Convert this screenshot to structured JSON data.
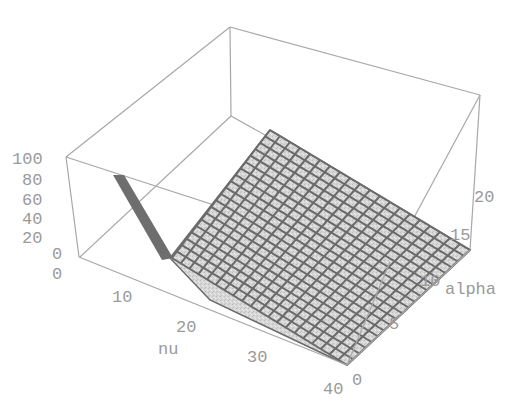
{
  "chart_data": {
    "type": "surface3d",
    "title": "",
    "xlabel": "nu",
    "ylabel": "alpha",
    "zlabel": "",
    "x_ticks": [
      "10",
      "20",
      "30",
      "40"
    ],
    "y_ticks": [
      "0",
      "5",
      "10",
      "15",
      "20"
    ],
    "z_ticks": [
      "0",
      "20",
      "40",
      "60",
      "80",
      "100"
    ],
    "xlim": [
      0,
      40
    ],
    "ylim": [
      0,
      20
    ],
    "zlim": [
      0,
      100
    ],
    "surface_samples": {
      "nu": [
        1,
        2,
        3,
        5,
        10,
        20,
        30,
        40
      ],
      "z_at_any_alpha": [
        100,
        60,
        20,
        3,
        0.5,
        0.1,
        0.05,
        0
      ]
    },
    "grid": true,
    "mesh_lines": 20
  },
  "axes": {
    "z_origin_label": "0",
    "nu_label": "nu",
    "alpha_label": "alpha"
  },
  "colors": {
    "surface_fill": "#cfcfcf",
    "mesh": "#6a6a6a",
    "spike": "#6e6e6e",
    "box": "#a8a8a8",
    "text": "#9a9a9a"
  }
}
